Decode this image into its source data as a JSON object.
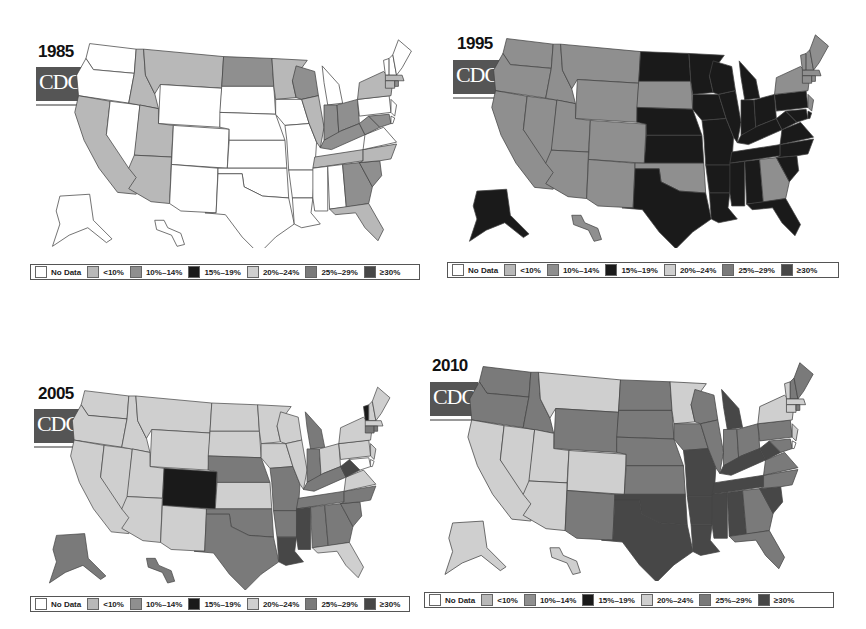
{
  "colors": {
    "no_data": "#ffffff",
    "lt10": "#b8b8b8",
    "10_14": "#8f8f8f",
    "15_19": "#1a1a1a",
    "20_24": "#cfcfcf",
    "25_29": "#7a7a7a",
    "ge30": "#474747"
  },
  "legend": [
    {
      "key": "no_data",
      "label": "No Data"
    },
    {
      "key": "lt10",
      "label": "<10%"
    },
    {
      "key": "10_14",
      "label": "10%–14%"
    },
    {
      "key": "15_19",
      "label": "15%–19%"
    },
    {
      "key": "20_24",
      "label": "20%–24%"
    },
    {
      "key": "25_29",
      "label": "25%–29%"
    },
    {
      "key": "ge30",
      "label": "≥30%"
    }
  ],
  "logo": {
    "text": "CDC"
  },
  "panels": [
    {
      "year": "1985"
    },
    {
      "year": "1995"
    },
    {
      "year": "2005"
    },
    {
      "year": "2010"
    }
  ],
  "chart_data": [
    {
      "type": "heatmap",
      "title": "1985",
      "subtitle": "Obesity prevalence among U.S. adults by state (choropleth map)",
      "legend": [
        "No Data",
        "<10%",
        "10%–14%",
        "15%–19%",
        "20%–24%",
        "25%–29%",
        "≥30%"
      ],
      "states": {
        "WA": "No Data",
        "OR": "No Data",
        "NV": "No Data",
        "WY": "No Data",
        "CO": "No Data",
        "NM": "No Data",
        "TX": "No Data",
        "SD": "No Data",
        "NE": "No Data",
        "KS": "No Data",
        "OK": "No Data",
        "IA": "No Data",
        "MO": "No Data",
        "AR": "No Data",
        "LA": "No Data",
        "MS": "No Data",
        "AL": "No Data",
        "MI": "No Data",
        "PA": "No Data",
        "VA": "No Data",
        "NJ": "No Data",
        "ME": "No Data",
        "NH": "No Data",
        "VT": "No Data",
        "AK": "No Data",
        "HI": "No Data",
        "CA": "<10%",
        "ID": "<10%",
        "MT": "<10%",
        "UT": "<10%",
        "AZ": "<10%",
        "MN": "<10%",
        "IL": "<10%",
        "NY": "<10%",
        "TN": "<10%",
        "NC": "<10%",
        "FL": "<10%",
        "MA": "<10%",
        "CT": "<10%",
        "ND": "10%–14%",
        "WI": "10%–14%",
        "IN": "10%–14%",
        "OH": "10%–14%",
        "KY": "10%–14%",
        "WV": "10%–14%",
        "GA": "10%–14%",
        "SC": "10%–14%",
        "MD": "10%–14%",
        "RI": "10%–14%"
      }
    },
    {
      "type": "heatmap",
      "title": "1995",
      "legend": [
        "No Data",
        "<10%",
        "10%–14%",
        "15%–19%",
        "20%–24%",
        "25%–29%",
        "≥30%"
      ],
      "states": {
        "WA": "10%–14%",
        "OR": "10%–14%",
        "CA": "10%–14%",
        "NV": "10%–14%",
        "ID": "10%–14%",
        "MT": "10%–14%",
        "WY": "10%–14%",
        "UT": "10%–14%",
        "CO": "10%–14%",
        "AZ": "10%–14%",
        "NM": "10%–14%",
        "SD": "10%–14%",
        "OK": "10%–14%",
        "GA": "10%–14%",
        "ME": "10%–14%",
        "NH": "10%–14%",
        "VT": "10%–14%",
        "MA": "10%–14%",
        "NY": "10%–14%",
        "CT": "10%–14%",
        "RI": "10%–14%",
        "NJ": "10%–14%",
        "HI": "10%–14%",
        "ND": "15%–19%",
        "MN": "15%–19%",
        "WI": "15%–19%",
        "MI": "15%–19%",
        "NE": "15%–19%",
        "KS": "15%–19%",
        "IA": "15%–19%",
        "IL": "15%–19%",
        "IN": "15%–19%",
        "OH": "15%–19%",
        "PA": "15%–19%",
        "MO": "15%–19%",
        "KY": "15%–19%",
        "WV": "15%–19%",
        "VA": "15%–19%",
        "TX": "15%–19%",
        "AR": "15%–19%",
        "LA": "15%–19%",
        "MS": "15%–19%",
        "AL": "15%–19%",
        "TN": "15%–19%",
        "NC": "15%–19%",
        "SC": "15%–19%",
        "FL": "15%–19%",
        "MD": "15%–19%",
        "DE": "15%–19%",
        "AK": "15%–19%"
      }
    },
    {
      "type": "heatmap",
      "title": "2005",
      "legend": [
        "No Data",
        "<10%",
        "10%–14%",
        "15%–19%",
        "20%–24%",
        "25%–29%",
        "≥30%"
      ],
      "states": {
        "CO": "15%–19%",
        "VT": "15%–19%",
        "WA": "20%–24%",
        "OR": "20%–24%",
        "CA": "20%–24%",
        "NV": "20%–24%",
        "ID": "20%–24%",
        "MT": "20%–24%",
        "WY": "20%–24%",
        "UT": "20%–24%",
        "AZ": "20%–24%",
        "NM": "20%–24%",
        "ND": "20%–24%",
        "SD": "20%–24%",
        "KS": "20%–24%",
        "MN": "20%–24%",
        "IA": "20%–24%",
        "WI": "20%–24%",
        "IL": "20%–24%",
        "OH": "20%–24%",
        "PA": "20%–24%",
        "NY": "20%–24%",
        "VA": "20%–24%",
        "ME": "20%–24%",
        "NH": "20%–24%",
        "MA": "20%–24%",
        "NJ": "20%–24%",
        "FL": "20%–24%",
        "NE": "25%–29%",
        "OK": "25%–29%",
        "TX": "25%–29%",
        "MO": "25%–29%",
        "AR": "25%–29%",
        "MI": "25%–29%",
        "IN": "25%–29%",
        "KY": "25%–29%",
        "TN": "25%–29%",
        "AL": "25%–29%",
        "GA": "25%–29%",
        "SC": "25%–29%",
        "NC": "25%–29%",
        "AK": "25%–29%",
        "HI": "25%–29%",
        "CT": "25%–29%",
        "RI": "25%–29%",
        "LA": "≥30%",
        "MS": "≥30%",
        "WV": "≥30%"
      }
    },
    {
      "type": "heatmap",
      "title": "2010",
      "legend": [
        "No Data",
        "<10%",
        "10%–14%",
        "15%–19%",
        "20%–24%",
        "25%–29%",
        "≥30%"
      ],
      "states": {
        "CA": "20%–24%",
        "NV": "20%–24%",
        "UT": "20%–24%",
        "CO": "20%–24%",
        "AZ": "20%–24%",
        "MT": "20%–24%",
        "MN": "20%–24%",
        "NY": "20%–24%",
        "VT": "20%–24%",
        "MA": "20%–24%",
        "CT": "20%–24%",
        "NJ": "20%–24%",
        "AK": "20%–24%",
        "HI": "20%–24%",
        "WA": "25%–29%",
        "OR": "25%–29%",
        "ID": "25%–29%",
        "WY": "25%–29%",
        "NM": "25%–29%",
        "ND": "25%–29%",
        "SD": "25%–29%",
        "NE": "25%–29%",
        "KS": "25%–29%",
        "IA": "25%–29%",
        "WI": "25%–29%",
        "IL": "25%–29%",
        "IN": "25%–29%",
        "OH": "25%–29%",
        "PA": "25%–29%",
        "VA": "25%–29%",
        "NC": "25%–29%",
        "GA": "25%–29%",
        "FL": "25%–29%",
        "ME": "25%–29%",
        "NH": "25%–29%",
        "RI": "25%–29%",
        "MD": "25%–29%",
        "TX": "≥30%",
        "OK": "≥30%",
        "MO": "≥30%",
        "AR": "≥30%",
        "LA": "≥30%",
        "MS": "≥30%",
        "AL": "≥30%",
        "TN": "≥30%",
        "KY": "≥30%",
        "WV": "≥30%",
        "MI": "≥30%",
        "SC": "≥30%"
      }
    }
  ]
}
